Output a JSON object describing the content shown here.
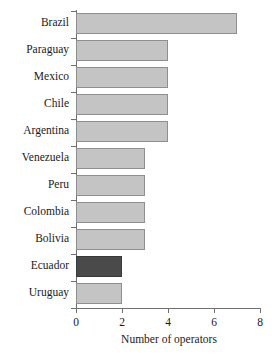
{
  "chart_data": {
    "type": "bar",
    "orientation": "horizontal",
    "title": "",
    "xlabel": "Number of operators",
    "ylabel": "",
    "categories": [
      "Brazil",
      "Paraguay",
      "Mexico",
      "Chile",
      "Argentina",
      "Venezuela",
      "Peru",
      "Colombia",
      "Bolivia",
      "Ecuador",
      "Uruguay"
    ],
    "values": [
      7,
      4,
      4,
      4,
      4,
      3,
      3,
      3,
      3,
      2,
      2
    ],
    "highlighted": [
      "Ecuador"
    ],
    "xlim": [
      0,
      8
    ],
    "xticks": [
      0,
      2,
      4,
      6,
      8
    ],
    "xtick_labels": [
      "0",
      "2",
      "4",
      "6",
      "8"
    ],
    "grid": false,
    "legend": false,
    "colors": {
      "bar_fill": "#c4c4c4",
      "bar_border": "#8f8f8f",
      "highlight_fill": "#4a4a4a",
      "highlight_border": "#3a3a3a",
      "axis": "#707070",
      "text": "#1a1a1a",
      "background": "#ffffff"
    }
  }
}
